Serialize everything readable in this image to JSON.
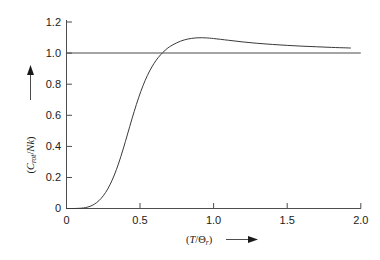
{
  "chart_data": {
    "type": "line",
    "title": "",
    "subtitle": "",
    "xlabel": "(T/Θr)",
    "xlabel_parts": {
      "open_paren": "(",
      "numerator": "T",
      "slash": "/",
      "denominator": "Θ",
      "subscript": "r",
      "close_paren": ")",
      "arrow": "⟶"
    },
    "ylabel": "(Crot/Nk)",
    "ylabel_parts": {
      "open_paren": "(",
      "symbol": "C",
      "subscript": "rot",
      "slash": "/",
      "denominator": "Nk",
      "close_paren": ")",
      "arrow": "↑"
    },
    "xlim": [
      0,
      2.0
    ],
    "ylim": [
      0,
      1.28
    ],
    "xticks": [
      0,
      0.5,
      1.0,
      1.5,
      2.0
    ],
    "xticklabels": [
      "0",
      "0.5",
      "1.0",
      "1.5",
      "2.0"
    ],
    "yticks": [
      0,
      0.2,
      0.4,
      0.6,
      0.8,
      1.0,
      1.2
    ],
    "yticklabels": [
      "0",
      "0.2",
      "0.4",
      "0.6",
      "0.8",
      "1.0",
      "1.2"
    ],
    "grid": false,
    "legend": false,
    "legend_position": "none",
    "line_color": "#3a3a3a",
    "axis_color": "#4d4d4d",
    "background_color": "#ffffff",
    "series": [
      {
        "name": "C_rot/Nk",
        "x": [
          0.0,
          0.05,
          0.1,
          0.13,
          0.16,
          0.19,
          0.22,
          0.25,
          0.28,
          0.31,
          0.34,
          0.37,
          0.4,
          0.43,
          0.46,
          0.49,
          0.52,
          0.55,
          0.58,
          0.61,
          0.64,
          0.67,
          0.7,
          0.75,
          0.8,
          0.85,
          0.9,
          0.95,
          1.0,
          1.1,
          1.2,
          1.3,
          1.4,
          1.5,
          1.6,
          1.7,
          1.8,
          1.9,
          1.93
        ],
        "y": [
          0.0,
          0.0,
          0.002,
          0.006,
          0.014,
          0.028,
          0.05,
          0.082,
          0.125,
          0.182,
          0.252,
          0.336,
          0.43,
          0.528,
          0.624,
          0.712,
          0.79,
          0.856,
          0.91,
          0.954,
          0.989,
          1.017,
          1.04,
          1.066,
          1.084,
          1.094,
          1.098,
          1.097,
          1.093,
          1.082,
          1.071,
          1.062,
          1.055,
          1.049,
          1.044,
          1.04,
          1.036,
          1.033,
          1.032
        ]
      },
      {
        "name": "classical limit",
        "type": "horizontal-asymptote",
        "x": [
          0.0,
          2.0
        ],
        "y": [
          1.0,
          1.0
        ]
      }
    ],
    "annotations": [
      {
        "text": "peak value",
        "x": 0.88,
        "y": 1.098
      },
      {
        "text": "high-T limit",
        "x": 2.0,
        "y": 1.0
      }
    ]
  }
}
